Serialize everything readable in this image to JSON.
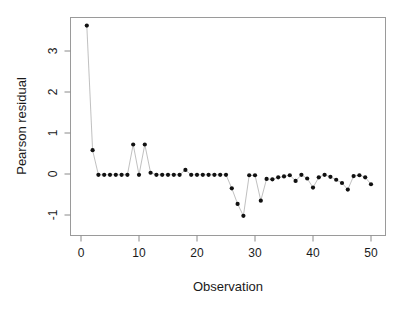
{
  "chart_data": {
    "type": "scatter",
    "title": "",
    "subtitle": "",
    "xlabel": "Observation",
    "ylabel": "Pearson residual",
    "xlim": [
      0,
      51
    ],
    "ylim": [
      -1.35,
      3.8
    ],
    "xticks": [
      0,
      10,
      20,
      30,
      40,
      50
    ],
    "yticks": [
      -1,
      0,
      1,
      2,
      3
    ],
    "xtick_labels": [
      "0",
      "10",
      "20",
      "30",
      "40",
      "50"
    ],
    "ytick_labels": [
      "-1",
      "0",
      "1",
      "2",
      "3"
    ],
    "grid": false,
    "legend": "none",
    "marker": "filled-circle",
    "line_style": "solid-thin-gray",
    "point_color": "#111111",
    "line_color": "#b0b0b0",
    "frame_color": "#9a9a9a",
    "x": [
      1,
      2,
      3,
      4,
      5,
      6,
      7,
      8,
      9,
      10,
      11,
      12,
      13,
      14,
      15,
      16,
      17,
      18,
      19,
      20,
      21,
      22,
      23,
      24,
      25,
      26,
      27,
      28,
      29,
      30,
      31,
      32,
      33,
      34,
      35,
      36,
      37,
      38,
      39,
      40,
      41,
      42,
      43,
      44,
      45,
      46,
      47,
      48,
      49,
      50
    ],
    "values": [
      3.62,
      0.58,
      -0.02,
      -0.02,
      -0.02,
      -0.02,
      -0.02,
      -0.02,
      0.72,
      -0.02,
      0.72,
      0.03,
      -0.02,
      -0.02,
      -0.02,
      -0.02,
      -0.02,
      0.1,
      -0.02,
      -0.02,
      -0.02,
      -0.02,
      -0.02,
      -0.02,
      -0.02,
      -0.35,
      -0.73,
      -1.02,
      -0.03,
      -0.03,
      -0.65,
      -0.12,
      -0.13,
      -0.08,
      -0.06,
      -0.03,
      -0.17,
      -0.02,
      -0.11,
      -0.33,
      -0.08,
      -0.02,
      -0.07,
      -0.14,
      -0.22,
      -0.38,
      -0.05,
      -0.03,
      -0.08,
      -0.25
    ],
    "series": [
      {
        "name": "Pearson residual",
        "values": [
          3.62,
          0.58,
          -0.02,
          -0.02,
          -0.02,
          -0.02,
          -0.02,
          -0.02,
          0.72,
          -0.02,
          0.72,
          0.03,
          -0.02,
          -0.02,
          -0.02,
          -0.02,
          -0.02,
          0.1,
          -0.02,
          -0.02,
          -0.02,
          -0.02,
          -0.02,
          -0.02,
          -0.02,
          -0.35,
          -0.73,
          -1.02,
          -0.03,
          -0.03,
          -0.65,
          -0.12,
          -0.13,
          -0.08,
          -0.06,
          -0.03,
          -0.17,
          -0.02,
          -0.11,
          -0.33,
          -0.08,
          -0.02,
          -0.07,
          -0.14,
          -0.22,
          -0.38,
          -0.05,
          -0.03,
          -0.08,
          -0.25
        ]
      }
    ]
  }
}
